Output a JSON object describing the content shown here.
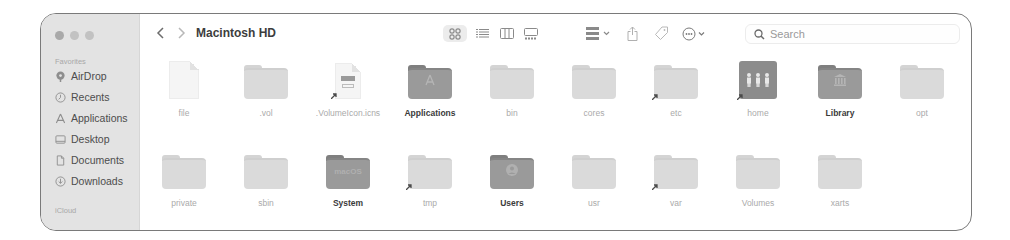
{
  "window": {
    "title": "Macintosh HD",
    "traffic_lights": [
      "close",
      "minimize",
      "zoom"
    ]
  },
  "sidebar": {
    "sections": [
      {
        "label": "Favorites",
        "items": [
          {
            "label": "AirDrop",
            "icon": "airdrop-icon"
          },
          {
            "label": "Recents",
            "icon": "clock-icon"
          },
          {
            "label": "Applications",
            "icon": "applications-icon"
          },
          {
            "label": "Desktop",
            "icon": "desktop-icon"
          },
          {
            "label": "Documents",
            "icon": "document-icon"
          },
          {
            "label": "Downloads",
            "icon": "download-icon"
          }
        ]
      },
      {
        "label": "iCloud",
        "items": []
      }
    ]
  },
  "toolbar": {
    "back_icon": "chevron-left-icon",
    "forward_icon": "chevron-right-icon",
    "views": [
      {
        "name": "icon-view",
        "active": true
      },
      {
        "name": "list-view",
        "active": false
      },
      {
        "name": "column-view",
        "active": false
      },
      {
        "name": "gallery-view",
        "active": false
      }
    ],
    "group_icon": "group-icon",
    "share_icon": "share-icon",
    "tag_icon": "tag-icon",
    "more_icon": "ellipsis-circle-icon",
    "search": {
      "placeholder": "Search",
      "value": ""
    }
  },
  "files": {
    "rows": [
      [
        {
          "name": "file",
          "kind": "document",
          "bold": false
        },
        {
          "name": ".vol",
          "kind": "folder-light",
          "bold": false
        },
        {
          "name": ".VolumeIcon.icns",
          "kind": "icns",
          "bold": false
        },
        {
          "name": "Applications",
          "kind": "folder-applications",
          "bold": true
        },
        {
          "name": "bin",
          "kind": "folder-light",
          "bold": false
        },
        {
          "name": "cores",
          "kind": "folder-light",
          "bold": false
        },
        {
          "name": "etc",
          "kind": "folder-alias",
          "bold": false
        },
        {
          "name": "home",
          "kind": "home",
          "bold": false
        },
        {
          "name": "Library",
          "kind": "folder-library",
          "bold": true
        },
        {
          "name": "opt",
          "kind": "folder-light",
          "bold": false
        }
      ],
      [
        {
          "name": "private",
          "kind": "folder-light",
          "bold": false
        },
        {
          "name": "sbin",
          "kind": "folder-light",
          "bold": false
        },
        {
          "name": "System",
          "kind": "folder-system",
          "bold": true
        },
        {
          "name": "tmp",
          "kind": "folder-alias",
          "bold": false
        },
        {
          "name": "Users",
          "kind": "folder-users",
          "bold": true
        },
        {
          "name": "usr",
          "kind": "folder-light",
          "bold": false
        },
        {
          "name": "var",
          "kind": "folder-alias",
          "bold": false
        },
        {
          "name": "Volumes",
          "kind": "folder-light",
          "bold": false
        },
        {
          "name": "xarts",
          "kind": "folder-light",
          "bold": false
        }
      ]
    ],
    "system_folder_glyph": "macOS"
  }
}
